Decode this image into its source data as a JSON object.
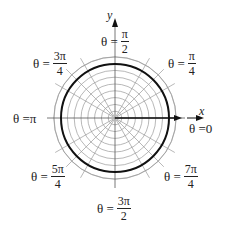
{
  "diagram": {
    "title": "",
    "type": "polar-grid",
    "center": {
      "x": 115,
      "y": 118
    },
    "grid": {
      "ring_count": 9,
      "ring_step": 6.8,
      "outer_radius": 61,
      "radial_angles_deg": [
        0,
        30,
        45,
        60,
        90,
        120,
        135,
        150,
        180,
        210,
        225,
        240,
        270,
        300,
        315,
        330
      ],
      "grid_color": "#9a9a9a"
    },
    "highlight_circle": {
      "radius": 54,
      "color": "#111111"
    },
    "ray": {
      "angle": "0",
      "length": 67,
      "color": "#111111"
    },
    "axes": {
      "x_label": "x",
      "y_label": "y"
    },
    "angle_labels": [
      {
        "id": "theta-0",
        "prefix": "θ = ",
        "value": "0"
      },
      {
        "id": "theta-pi-over-4",
        "prefix": "θ = ",
        "num": "π",
        "den": "4"
      },
      {
        "id": "theta-pi-over-2",
        "prefix": "θ = ",
        "num": "π",
        "den": "2"
      },
      {
        "id": "theta-3pi-over-4",
        "prefix": "θ = ",
        "num": "3π",
        "den": "4"
      },
      {
        "id": "theta-pi",
        "prefix": "θ = ",
        "value": "π"
      },
      {
        "id": "theta-5pi-over-4",
        "prefix": "θ = ",
        "num": "5π",
        "den": "4"
      },
      {
        "id": "theta-3pi-over-2",
        "prefix": "θ = ",
        "num": "3π",
        "den": "2"
      },
      {
        "id": "theta-7pi-over-4",
        "prefix": "θ = ",
        "num": "7π",
        "den": "4"
      }
    ]
  }
}
